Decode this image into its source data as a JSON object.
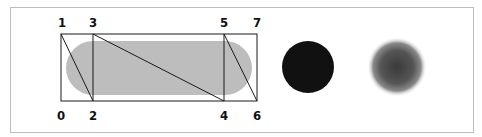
{
  "figure": {
    "labels": [
      {
        "id": "0",
        "text": "0",
        "x": 62,
        "y": 120
      },
      {
        "id": "1",
        "text": "1",
        "x": 62,
        "y": 28
      },
      {
        "id": "2",
        "text": "2",
        "x": 94,
        "y": 120
      },
      {
        "id": "3",
        "text": "3",
        "x": 94,
        "y": 28
      },
      {
        "id": "4",
        "text": "4",
        "x": 225,
        "y": 120
      },
      {
        "id": "5",
        "text": "5",
        "x": 225,
        "y": 28
      },
      {
        "id": "6",
        "text": "6",
        "x": 258,
        "y": 120
      },
      {
        "id": "7",
        "text": "7",
        "x": 258,
        "y": 28
      }
    ],
    "capsule_fill": "#bdbdbd",
    "solid_disc_color": "#111111",
    "blurred_disc_color": "#444444",
    "stroke_color": "#1a1a1a"
  }
}
